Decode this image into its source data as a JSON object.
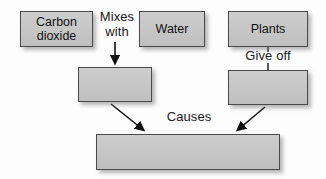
{
  "diagram": {
    "type": "flowchart",
    "colors": {
      "box_fill": "#c6c6c6",
      "box_border": "#4a4a4a",
      "text": "#111111",
      "background": "#fdfdfd",
      "arrow": "#111111"
    },
    "nodes": [
      {
        "id": "carbon_dioxide",
        "label": "Carbon\ndioxide",
        "empty": false
      },
      {
        "id": "water",
        "label": "Water",
        "empty": false
      },
      {
        "id": "plants",
        "label": "Plants",
        "empty": false
      },
      {
        "id": "blank_left",
        "label": "",
        "empty": true
      },
      {
        "id": "blank_right",
        "label": "",
        "empty": true
      },
      {
        "id": "blank_bottom",
        "label": "",
        "empty": true
      }
    ],
    "edge_labels": [
      {
        "id": "mixes_with",
        "label": "Mixes\nwith"
      },
      {
        "id": "give_off",
        "label": "Give off"
      },
      {
        "id": "causes",
        "label": "Causes"
      }
    ]
  }
}
